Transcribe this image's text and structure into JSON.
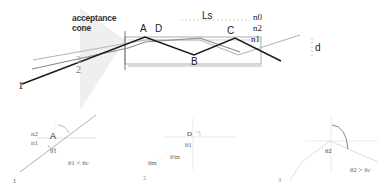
{
  "main_diagram": {
    "acceptance_cone_label": [
      "acceptance",
      "cone"
    ],
    "ray_labels": [
      "1",
      "2",
      "3"
    ],
    "point_labels": {
      "A": "A",
      "B": "B",
      "C": "C",
      "D": "D"
    },
    "length_label": "Ls",
    "layer_labels": [
      "n0",
      "n2",
      "n1"
    ],
    "thickness_label": "d"
  },
  "panels": [
    {
      "index": "1",
      "point": "A",
      "layer_labels": [
        "n2",
        "n1"
      ],
      "angle_label": "θ1",
      "condition": "θ1 < θc"
    },
    {
      "index": "2",
      "point": "D",
      "angle_labels": [
        "θ1",
        "θ'm",
        "θm"
      ]
    },
    {
      "index": "3",
      "angle_label": "θ2",
      "condition": "θ2 > θc"
    }
  ],
  "colors": {
    "ray1": "#1a1a1a",
    "ray2": "#8a8a8a",
    "ray3": "#b0b0b0",
    "guide": "#bbbbbb",
    "cone": "#ececec"
  }
}
